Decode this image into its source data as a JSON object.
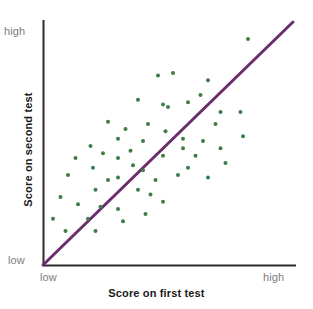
{
  "figure": {
    "background_color": "#ffffff",
    "point_color": "#3d7d4a",
    "line_color": "#6b2d6b",
    "axis_color": "#2b2b2b",
    "tick_label_color": "#7d7d7d",
    "axis_title_color": "#1a1a1a"
  },
  "axes": {
    "x": {
      "title": "Score on first test",
      "tick_low": "low",
      "tick_high": "high"
    },
    "y": {
      "title": "Score on second test",
      "tick_low": "low",
      "tick_high": "high"
    }
  },
  "chart_data": {
    "type": "scatter",
    "title": "",
    "subtitle": "",
    "xlabel": "Score on first test",
    "ylabel": "Score on second test",
    "xlim": [
      0,
      100
    ],
    "ylim": [
      0,
      100
    ],
    "xtick_labels": [
      "low",
      "high"
    ],
    "ytick_labels": [
      "low",
      "high"
    ],
    "xtick_values": [
      0,
      100
    ],
    "ytick_values": [
      0,
      100
    ],
    "grid": false,
    "legend": false,
    "legend_position": "none",
    "annotations": [],
    "series": [
      {
        "name": "students",
        "type": "scatter",
        "color": "#3d7d4a",
        "marker": "circle",
        "marker_size": 4,
        "points": [
          [
            82.0,
            93.0
          ],
          [
            46.0,
            78.0
          ],
          [
            66.0,
            76.0
          ],
          [
            38.0,
            68.0
          ],
          [
            58.0,
            67.0
          ],
          [
            48.0,
            66.0
          ],
          [
            50.0,
            65.0
          ],
          [
            71.0,
            63.0
          ],
          [
            79.0,
            63.0
          ],
          [
            26.0,
            59.0
          ],
          [
            69.0,
            58.0
          ],
          [
            42.0,
            58.0
          ],
          [
            33.0,
            56.0
          ],
          [
            80.0,
            53.0
          ],
          [
            56.0,
            52.0
          ],
          [
            64.0,
            51.0
          ],
          [
            40.0,
            51.0
          ],
          [
            19.0,
            49.0
          ],
          [
            56.0,
            48.0
          ],
          [
            71.0,
            48.0
          ],
          [
            35.0,
            47.0
          ],
          [
            24.0,
            46.0
          ],
          [
            48.0,
            45.0
          ],
          [
            61.0,
            45.0
          ],
          [
            30.0,
            44.0
          ],
          [
            20.0,
            40.0
          ],
          [
            40.0,
            39.0
          ],
          [
            10.0,
            37.0
          ],
          [
            30.0,
            36.0
          ],
          [
            54.0,
            37.0
          ],
          [
            66.0,
            36.0
          ],
          [
            21.0,
            31.0
          ],
          [
            38.0,
            31.0
          ],
          [
            43.0,
            29.0
          ],
          [
            7.0,
            28.0
          ],
          [
            14.0,
            25.0
          ],
          [
            23.0,
            24.0
          ],
          [
            30.0,
            23.0
          ],
          [
            48.0,
            26.0
          ],
          [
            4.0,
            19.0
          ],
          [
            18.0,
            19.0
          ],
          [
            32.0,
            18.0
          ],
          [
            9.0,
            14.0
          ],
          [
            21.0,
            14.0
          ],
          [
            52.0,
            79.0
          ],
          [
            63.0,
            70.0
          ],
          [
            30.0,
            52.0
          ],
          [
            36.0,
            41.0
          ],
          [
            45.0,
            35.0
          ],
          [
            58.0,
            40.0
          ],
          [
            49.0,
            55.0
          ],
          [
            73.0,
            42.0
          ],
          [
            26.0,
            35.0
          ],
          [
            13.0,
            44.0
          ],
          [
            41.0,
            21.0
          ]
        ]
      }
    ],
    "reference_line": {
      "name": "diagonal",
      "type": "line",
      "color": "#6b2d6b",
      "from": [
        0,
        0
      ],
      "to": [
        100,
        100
      ],
      "width": 3
    }
  }
}
